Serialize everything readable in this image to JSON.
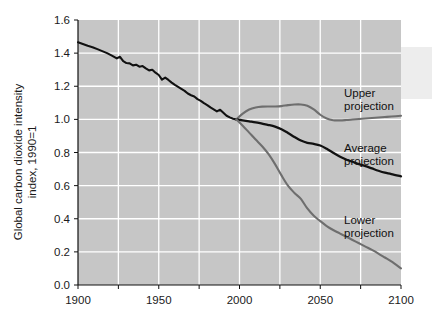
{
  "chart_data": {
    "type": "line",
    "title": "",
    "xlabel": "",
    "ylabel": "Global carbon dioxide intensity index, 1990=1",
    "ylabel_line1": "Global carbon dioxide intensity",
    "ylabel_line2": "index, 1990=1",
    "xlim": [
      1900,
      2100
    ],
    "ylim": [
      0.0,
      1.6
    ],
    "grid": true,
    "legend_position": "inline-annotations",
    "plot_background": "#c6c6c6",
    "gridline_color": "#ffffff",
    "xticks": [
      1900,
      1925,
      1950,
      1975,
      2000,
      2025,
      2050,
      2075,
      2100
    ],
    "xtick_labels": [
      "1900",
      "",
      "1950",
      "",
      "2000",
      "",
      "2050",
      "",
      "2100"
    ],
    "yticks": [
      0.0,
      0.2,
      0.4,
      0.6,
      0.8,
      1.0,
      1.2,
      1.4,
      1.6
    ],
    "ytick_labels": [
      "0.0",
      "0.2",
      "0.4",
      "0.6",
      "0.8",
      "1.0",
      "1.2",
      "1.4",
      "1.6"
    ],
    "series": [
      {
        "name": "Historical",
        "color": "#111111",
        "width": 2.1,
        "annotation": "",
        "x": [
          1900,
          1903,
          1906,
          1909,
          1912,
          1915,
          1918,
          1921,
          1924,
          1926,
          1928,
          1930,
          1932,
          1934,
          1936,
          1938,
          1940,
          1942,
          1944,
          1946,
          1948,
          1950,
          1952,
          1954,
          1956,
          1958,
          1960,
          1962,
          1964,
          1966,
          1968,
          1970,
          1972,
          1974,
          1976,
          1978,
          1980,
          1982,
          1984,
          1986,
          1988,
          1990,
          1992,
          1994,
          1996,
          1998
        ],
        "y": [
          1.465,
          1.455,
          1.444,
          1.436,
          1.424,
          1.412,
          1.4,
          1.385,
          1.368,
          1.378,
          1.352,
          1.34,
          1.338,
          1.326,
          1.33,
          1.318,
          1.322,
          1.308,
          1.296,
          1.3,
          1.282,
          1.268,
          1.24,
          1.252,
          1.238,
          1.222,
          1.208,
          1.196,
          1.184,
          1.172,
          1.156,
          1.146,
          1.138,
          1.122,
          1.112,
          1.098,
          1.086,
          1.072,
          1.06,
          1.048,
          1.058,
          1.04,
          1.022,
          1.012,
          1.004,
          1.0
        ]
      },
      {
        "name": "Upper projection",
        "color": "#6e6e6e",
        "width": 2.1,
        "annotation": "Upper projection",
        "annotation_line1": "Upper",
        "annotation_line2": "projection",
        "x": [
          1998,
          2002,
          2006,
          2010,
          2014,
          2018,
          2022,
          2026,
          2030,
          2034,
          2038,
          2042,
          2046,
          2050,
          2054,
          2058,
          2062,
          2066,
          2070,
          2074,
          2078,
          2082,
          2086,
          2090,
          2094,
          2100
        ],
        "y": [
          1.0,
          1.035,
          1.06,
          1.072,
          1.077,
          1.078,
          1.078,
          1.08,
          1.086,
          1.09,
          1.09,
          1.082,
          1.06,
          1.028,
          1.005,
          0.995,
          0.994,
          0.996,
          0.999,
          1.002,
          1.005,
          1.008,
          1.011,
          1.014,
          1.017,
          1.022
        ]
      },
      {
        "name": "Average projection",
        "color": "#111111",
        "width": 2.3,
        "annotation": "Average projection",
        "annotation_line1": "Average",
        "annotation_line2": "projection",
        "x": [
          1998,
          2002,
          2006,
          2010,
          2014,
          2018,
          2022,
          2026,
          2030,
          2034,
          2038,
          2042,
          2046,
          2050,
          2054,
          2058,
          2062,
          2066,
          2070,
          2074,
          2078,
          2082,
          2086,
          2090,
          2094,
          2100
        ],
        "y": [
          1.0,
          0.994,
          0.988,
          0.982,
          0.974,
          0.966,
          0.956,
          0.94,
          0.918,
          0.894,
          0.872,
          0.858,
          0.852,
          0.842,
          0.822,
          0.798,
          0.776,
          0.758,
          0.744,
          0.73,
          0.718,
          0.704,
          0.69,
          0.678,
          0.67,
          0.656
        ]
      },
      {
        "name": "Lower projection",
        "color": "#6e6e6e",
        "width": 2.1,
        "annotation": "Lower projection",
        "annotation_line1": "Lower",
        "annotation_line2": "projection",
        "x": [
          1998,
          2002,
          2006,
          2010,
          2014,
          2018,
          2022,
          2026,
          2030,
          2034,
          2038,
          2042,
          2046,
          2050,
          2054,
          2058,
          2062,
          2066,
          2070,
          2074,
          2078,
          2082,
          2086,
          2090,
          2094,
          2100
        ],
        "y": [
          1.0,
          0.962,
          0.92,
          0.878,
          0.838,
          0.79,
          0.73,
          0.662,
          0.6,
          0.556,
          0.52,
          0.462,
          0.418,
          0.386,
          0.356,
          0.332,
          0.312,
          0.292,
          0.272,
          0.252,
          0.232,
          0.212,
          0.19,
          0.166,
          0.142,
          0.1
        ]
      }
    ]
  },
  "annotations": {
    "upper": {
      "line1": "Upper",
      "line2": "projection"
    },
    "average": {
      "line1": "Average",
      "line2": "projection"
    },
    "lower": {
      "line1": "Lower",
      "line2": "projection"
    }
  }
}
